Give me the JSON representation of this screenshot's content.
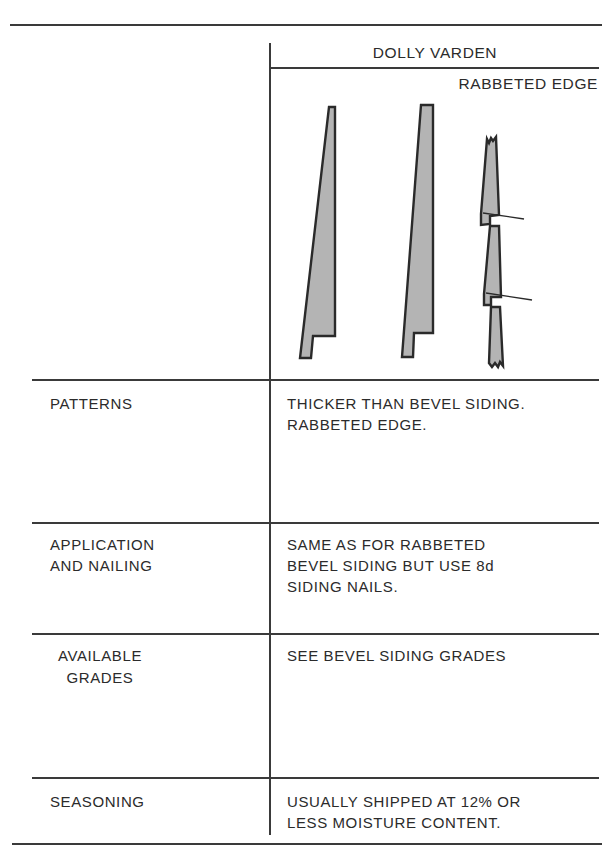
{
  "header": {
    "column_title": "DOLLY VARDEN",
    "subtitle": "RABBETED EDGE"
  },
  "figure": {
    "fill_color": "#b4b4b4",
    "stroke_color": "#2a2a2a"
  },
  "rows": [
    {
      "label": [
        "PATTERNS"
      ],
      "value": [
        "THICKER THAN BEVEL SIDING.",
        "RABBETED EDGE."
      ]
    },
    {
      "label": [
        "APPLICATION",
        "AND NAILING"
      ],
      "value": [
        "SAME AS FOR RABBETED",
        "BEVEL SIDING BUT USE 8d",
        "SIDING NAILS."
      ]
    },
    {
      "label": [
        "AVAILABLE",
        "GRADES"
      ],
      "value": [
        "SEE BEVEL SIDING GRADES"
      ]
    },
    {
      "label": [
        "SEASONING"
      ],
      "value": [
        "USUALLY SHIPPED AT 12% OR",
        "LESS MOISTURE CONTENT."
      ]
    }
  ]
}
